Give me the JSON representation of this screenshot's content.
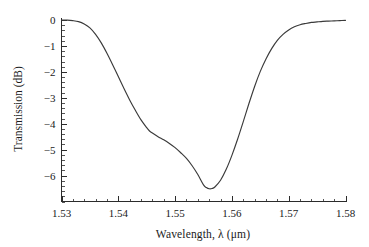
{
  "chart_data": {
    "type": "line",
    "title": "",
    "xlabel": "Wavelength, λ (μm)",
    "ylabel": "Transmission (dB)",
    "xlim": [
      1.53,
      1.58
    ],
    "ylim": [
      -7.0,
      0.1
    ],
    "grid": false,
    "legend": false,
    "xtick_labels": [
      "1.53",
      "1.54",
      "1.55",
      "1.56",
      "1.57",
      "1.58"
    ],
    "xtick_values": [
      1.53,
      1.54,
      1.55,
      1.56,
      1.57,
      1.58
    ],
    "x_minor_interval": 0.002,
    "ytick_labels": [
      "0",
      "−1",
      "−2",
      "−3",
      "−4",
      "−5",
      "−6"
    ],
    "ytick_values": [
      0,
      -1,
      -2,
      -3,
      -4,
      -5,
      -6
    ],
    "y_minor_interval": 0.2,
    "line_color": "#3a3a3a",
    "background_color": "#ffffff",
    "axis_color": "#2b2b2b",
    "series": [
      {
        "name": "transmission",
        "x": [
          1.53,
          1.531,
          1.532,
          1.533,
          1.534,
          1.535,
          1.536,
          1.537,
          1.538,
          1.539,
          1.54,
          1.541,
          1.542,
          1.543,
          1.544,
          1.545,
          1.5455,
          1.546,
          1.547,
          1.548,
          1.549,
          1.55,
          1.551,
          1.552,
          1.553,
          1.554,
          1.555,
          1.5555,
          1.556,
          1.5565,
          1.557,
          1.558,
          1.559,
          1.56,
          1.561,
          1.562,
          1.563,
          1.564,
          1.565,
          1.566,
          1.567,
          1.568,
          1.569,
          1.57,
          1.571,
          1.572,
          1.573,
          1.574,
          1.575,
          1.576,
          1.577,
          1.578,
          1.579,
          1.58
        ],
        "y": [
          0.0,
          0.0,
          -0.02,
          -0.06,
          -0.15,
          -0.3,
          -0.55,
          -0.88,
          -1.28,
          -1.72,
          -2.18,
          -2.64,
          -3.08,
          -3.48,
          -3.85,
          -4.15,
          -4.28,
          -4.36,
          -4.5,
          -4.62,
          -4.76,
          -4.92,
          -5.12,
          -5.34,
          -5.62,
          -5.96,
          -6.36,
          -6.46,
          -6.51,
          -6.5,
          -6.44,
          -6.18,
          -5.76,
          -5.22,
          -4.6,
          -3.92,
          -3.22,
          -2.56,
          -1.98,
          -1.5,
          -1.1,
          -0.78,
          -0.55,
          -0.38,
          -0.26,
          -0.18,
          -0.13,
          -0.09,
          -0.07,
          -0.05,
          -0.04,
          -0.03,
          -0.02,
          -0.01
        ]
      }
    ],
    "annotations": {
      "minimum_wavelength_um": 1.5565,
      "minimum_transmission_db": -6.5,
      "shoulder_wavelength_um": 1.546,
      "shoulder_transmission_db": -4.3
    }
  }
}
